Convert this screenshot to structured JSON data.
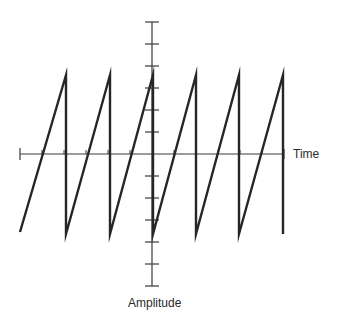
{
  "diagram": {
    "title": "",
    "labels": {
      "x_axis": "Time",
      "y_axis": "Amplitude"
    },
    "colors": {
      "background": "#ffffff",
      "axis": "#3a3a3a",
      "waveform": "#262626",
      "text": "#2a2a2a"
    },
    "geometry": {
      "origin_x": 152,
      "origin_y": 154,
      "x_axis_start": 20,
      "x_axis_end": 284,
      "y_axis_top": 22,
      "y_axis_bottom": 286,
      "y_tick_spacing": 22,
      "y_tick_half_width": 7,
      "x_tick_spacing": 22,
      "x_tick_height": 4
    },
    "waveform": {
      "type": "sawtooth",
      "cycles_shown": 6,
      "period_px": 43.6,
      "start_x": 20,
      "peak_y": 75,
      "trough_y": 232,
      "drop_x": [
        66,
        110,
        153,
        196,
        239,
        283
      ],
      "stroke_width": 2.4
    }
  },
  "chart_data": {
    "type": "line",
    "title": "",
    "subtitle": "",
    "xlabel": "Time",
    "ylabel": "Amplitude",
    "grid": false,
    "legend": null,
    "series": [
      {
        "name": "sawtooth",
        "x": [
          -3.0,
          -2.0,
          -2.0,
          -1.0,
          -1.0,
          0.0,
          0.0,
          1.0,
          1.0,
          2.0,
          2.0,
          3.0,
          3.0
        ],
        "y": [
          -1,
          1,
          -1,
          1,
          -1,
          1,
          -1,
          1,
          -1,
          1,
          -1,
          1,
          -1
        ]
      }
    ],
    "y_ticks_count_each_side": 6,
    "xlim": [
      -3.05,
      3.0
    ],
    "ylim": [
      -1.68,
      1.68
    ]
  }
}
